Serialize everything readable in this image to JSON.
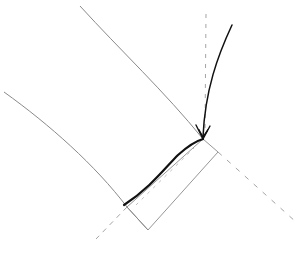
{
  "diagram": {
    "title": "",
    "description": "Geometric line sketch: two gray curves, a thick black curve segment, a curved arrow, a tilted rectangle and dashed construction lines",
    "colors": {
      "background": "#ffffff",
      "thin_curve": "#8a8a8a",
      "thick_curve": "#111111",
      "arrow": "#111111",
      "dashed": "#9a9a9a",
      "rectangle": "#8a8a8a"
    },
    "elements": {
      "upper_curve": "upper-gray-curve",
      "lower_curve": "lower-gray-curve",
      "thick_curve": "thick-black-curve",
      "arrow": "curved-arrow",
      "rectangle": "tilted-rectangle",
      "dashed_vertical": "dashed-vertical-line",
      "dashed_diagonal_right": "dashed-diagonal-right",
      "dashed_diagonal_left": "dashed-diagonal-left"
    }
  }
}
